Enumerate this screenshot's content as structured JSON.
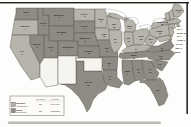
{
  "legend": {
    "columns": [
      "Electoral",
      "Popular"
    ],
    "rows": [
      {
        "id": "mckinley",
        "name": "McKinley",
        "party": "(Republican)",
        "electoral": "271",
        "popular": "7,104,779",
        "color": "#b7b4ab"
      },
      {
        "id": "bryan",
        "name": "Bryan",
        "party": "(Democrat)",
        "electoral": "176",
        "popular": "6,502,925",
        "color": "#8e8b84"
      }
    ]
  },
  "map": {
    "colors": {
      "territory": "#f5f4ef",
      "border": "#57544c",
      "water": "#ffffff",
      "label": "#22201c",
      "lake_stroke": "#8f8c85",
      "frame": "#1d1d1b",
      "page_shadow": "#bcbab3"
    },
    "states": [
      {
        "id": "washington",
        "label": "WASH.",
        "ev": "4",
        "winner": "bryan"
      },
      {
        "id": "oregon",
        "label": "OREGON",
        "ev": "4",
        "winner": "mckinley"
      },
      {
        "id": "california",
        "label": "CAL.",
        "ev": "9",
        "winner": "mckinley"
      },
      {
        "id": "nevada",
        "label": "NEVADA",
        "ev": "3",
        "winner": "bryan"
      },
      {
        "id": "idaho",
        "label": "IDAHO",
        "ev": "3",
        "winner": "bryan"
      },
      {
        "id": "montana",
        "label": "MONTANA",
        "ev": "3",
        "winner": "bryan"
      },
      {
        "id": "wyoming",
        "label": "WYOMING",
        "ev": "3",
        "winner": "bryan"
      },
      {
        "id": "utah",
        "label": "UTAH",
        "ev": "3",
        "winner": "bryan"
      },
      {
        "id": "colorado",
        "label": "COLORADO",
        "ev": "4",
        "winner": "bryan"
      },
      {
        "id": "north-dakota",
        "label": "N. DAK.",
        "ev": "3",
        "winner": "mckinley"
      },
      {
        "id": "south-dakota",
        "label": "S. DAK.",
        "ev": "4",
        "winner": "bryan"
      },
      {
        "id": "nebraska",
        "label": "NEBRASKA",
        "ev": "8",
        "winner": "bryan"
      },
      {
        "id": "kansas",
        "label": "KANSAS",
        "ev": "10",
        "winner": "bryan"
      },
      {
        "id": "texas",
        "label": "TEXAS",
        "ev": "15",
        "winner": "bryan"
      },
      {
        "id": "minnesota",
        "label": "MINN.",
        "ev": "9",
        "winner": "mckinley"
      },
      {
        "id": "iowa",
        "label": "IOWA",
        "ev": "13",
        "winner": "mckinley"
      },
      {
        "id": "missouri",
        "label": "MO.",
        "ev": "17",
        "winner": "bryan"
      },
      {
        "id": "arkansas",
        "label": "ARK.",
        "ev": "8",
        "winner": "bryan"
      },
      {
        "id": "louisiana",
        "label": "LA.",
        "ev": "8",
        "winner": "bryan"
      },
      {
        "id": "wisconsin",
        "label": "WIS.",
        "ev": "12",
        "winner": "mckinley"
      },
      {
        "id": "illinois",
        "label": "ILL.",
        "ev": "24",
        "winner": "mckinley"
      },
      {
        "id": "michigan",
        "label": "MICH.",
        "ev": "14",
        "winner": "mckinley"
      },
      {
        "id": "indiana",
        "label": "IND.",
        "ev": "15",
        "winner": "mckinley"
      },
      {
        "id": "ohio",
        "label": "OHIO",
        "ev": "23",
        "winner": "mckinley"
      },
      {
        "id": "kentucky",
        "label": "KY.",
        "ev": "13",
        "winner": "mckinley"
      },
      {
        "id": "tennessee",
        "label": "TENN.",
        "ev": "12",
        "winner": "bryan"
      },
      {
        "id": "mississippi",
        "label": "MISS.",
        "ev": "9",
        "winner": "bryan"
      },
      {
        "id": "alabama",
        "label": "ALA.",
        "ev": "11",
        "winner": "bryan"
      },
      {
        "id": "georgia",
        "label": "GA.",
        "ev": "13",
        "winner": "bryan"
      },
      {
        "id": "florida",
        "label": "FLA.",
        "ev": "4",
        "winner": "bryan"
      },
      {
        "id": "south-carolina",
        "label": "S.C.",
        "ev": "9",
        "winner": "bryan"
      },
      {
        "id": "north-carolina",
        "label": "N.C.",
        "ev": "11",
        "winner": "bryan"
      },
      {
        "id": "virginia",
        "label": "VA.",
        "ev": "12",
        "winner": "bryan"
      },
      {
        "id": "west-virginia",
        "label": "W.VA.",
        "ev": "6",
        "winner": "mckinley"
      },
      {
        "id": "pennsylvania",
        "label": "PENNA.",
        "ev": "32",
        "winner": "mckinley"
      },
      {
        "id": "new-york",
        "label": "NEW YORK",
        "ev": "36",
        "winner": "mckinley"
      },
      {
        "id": "maine",
        "label": "MAINE",
        "ev": "6",
        "winner": "mckinley"
      },
      {
        "id": "vermont",
        "label": "VT.",
        "ev": "4",
        "winner": "mckinley",
        "offshore": true
      },
      {
        "id": "new-hampshire",
        "label": "N.H.",
        "ev": "4",
        "winner": "mckinley",
        "offshore": true
      },
      {
        "id": "massachusetts",
        "label": "MASS.",
        "ev": "15",
        "winner": "mckinley",
        "offshore": true
      },
      {
        "id": "rhode-island",
        "label": "R.I.",
        "ev": "4",
        "winner": "mckinley",
        "offshore": true
      },
      {
        "id": "connecticut",
        "label": "CONN.",
        "ev": "6",
        "winner": "mckinley",
        "offshore": true
      },
      {
        "id": "new-jersey",
        "label": "N.J.",
        "ev": "10",
        "winner": "mckinley",
        "offshore": true
      },
      {
        "id": "delaware",
        "label": "DEL.",
        "ev": "3",
        "winner": "mckinley",
        "offshore": true
      },
      {
        "id": "maryland",
        "label": "MD.",
        "ev": "8",
        "winner": "mckinley",
        "offshore": true
      },
      {
        "id": "arizona-territory",
        "label": "",
        "ev": "",
        "winner": "territory"
      },
      {
        "id": "new-mexico-territory",
        "label": "",
        "ev": "",
        "winner": "territory"
      },
      {
        "id": "oklahoma-indian-territory",
        "label": "",
        "ev": "",
        "winner": "territory"
      }
    ]
  }
}
